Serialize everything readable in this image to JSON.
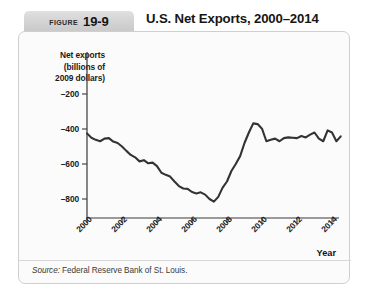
{
  "header": {
    "figure_word": "Figure",
    "figure_number": "19-9",
    "title": "U.S. Net Exports, 2000–2014"
  },
  "source": {
    "label": "Source:",
    "text": "Federal Reserve Bank of St. Louis."
  },
  "chart_data": {
    "type": "line",
    "title": "U.S. Net Exports, 2000–2014",
    "xlabel": "Year",
    "ylabel": "Net exports (billions of 2009 dollars)",
    "ylabel_lines": [
      "Net exports",
      "(billions of",
      "2009 dollars)"
    ],
    "xlim": [
      2000,
      2014.75
    ],
    "ylim": [
      -900,
      -120
    ],
    "yticks": [
      -200,
      -400,
      -600,
      -800
    ],
    "ytick_labels": [
      "–200",
      "–400",
      "–600",
      "–800"
    ],
    "xticks": [
      2000,
      2002,
      2004,
      2006,
      2008,
      2010,
      2012,
      2014
    ],
    "xtick_labels": [
      "2000",
      "2002",
      "2004",
      "2006",
      "2008",
      "2010",
      "2012",
      "2014"
    ],
    "grid": false,
    "legend": false,
    "line_color": "#333333",
    "series": [
      {
        "name": "Net exports",
        "x": [
          2000.0,
          2000.25,
          2000.5,
          2000.75,
          2001.0,
          2001.25,
          2001.5,
          2001.75,
          2002.0,
          2002.25,
          2002.5,
          2002.75,
          2003.0,
          2003.25,
          2003.5,
          2003.75,
          2004.0,
          2004.25,
          2004.5,
          2004.75,
          2005.0,
          2005.25,
          2005.5,
          2005.75,
          2006.0,
          2006.25,
          2006.5,
          2006.75,
          2007.0,
          2007.25,
          2007.5,
          2007.75,
          2008.0,
          2008.25,
          2008.5,
          2008.75,
          2009.0,
          2009.25,
          2009.5,
          2009.75,
          2010.0,
          2010.25,
          2010.5,
          2010.75,
          2011.0,
          2011.25,
          2011.5,
          2011.75,
          2012.0,
          2012.25,
          2012.5,
          2012.75,
          2013.0,
          2013.25,
          2013.5,
          2013.75,
          2014.0,
          2014.25,
          2014.5
        ],
        "values": [
          -425,
          -450,
          -462,
          -470,
          -455,
          -452,
          -472,
          -480,
          -500,
          -525,
          -548,
          -562,
          -585,
          -578,
          -596,
          -592,
          -612,
          -650,
          -662,
          -672,
          -700,
          -726,
          -740,
          -742,
          -760,
          -768,
          -762,
          -775,
          -800,
          -815,
          -788,
          -735,
          -700,
          -640,
          -600,
          -555,
          -480,
          -420,
          -368,
          -372,
          -398,
          -470,
          -462,
          -455,
          -470,
          -452,
          -448,
          -450,
          -452,
          -440,
          -448,
          -432,
          -420,
          -455,
          -470,
          -408,
          -420,
          -470,
          -442
        ]
      }
    ]
  }
}
